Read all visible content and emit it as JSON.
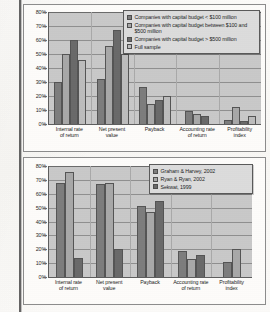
{
  "page": {
    "gutter_present": true
  },
  "charts": [
    {
      "id": "capital-budget-size-chart",
      "legend": [
        {
          "label": "Companies with capital budget < $100 million",
          "color": "#7d7d7d"
        },
        {
          "label": "Companies with capital budget between $100 and $500 million",
          "color": "#a8a8a8"
        },
        {
          "label": "Companies with capital budget > $500 million",
          "color": "#6a6a6a"
        },
        {
          "label": "Full sample",
          "color": "#bdbdbd"
        }
      ],
      "yticks": [
        "0%",
        "10%",
        "20%",
        "30%",
        "40%",
        "50%",
        "60%",
        "70%",
        "80%"
      ],
      "categories": [
        "Internal rate of return",
        "Net present value",
        "Payback",
        "Accounting rate of return",
        "Profitability index"
      ]
    },
    {
      "id": "studies-comparison-chart",
      "legend": [
        {
          "label": "Graham & Harvey, 2002",
          "color": "#7d7d7d"
        },
        {
          "label": "Ryan & Ryan, 2002",
          "color": "#a8a8a8"
        },
        {
          "label": "Sekwat, 1999",
          "color": "#6a6a6a"
        }
      ],
      "yticks": [
        "0%",
        "10%",
        "20%",
        "30%",
        "40%",
        "50%",
        "60%",
        "70%",
        "80%"
      ],
      "categories": [
        "Internal rate of return",
        "Net present value",
        "Payback",
        "Accounting rate of return",
        "Profitability index"
      ]
    }
  ],
  "chart_data": [
    {
      "type": "bar",
      "title": "",
      "xlabel": "",
      "ylabel": "",
      "ylim": [
        0,
        80
      ],
      "yunit": "%",
      "grid": true,
      "legend_position": "upper-right",
      "categories": [
        "Internal rate of return",
        "Net present value",
        "Payback",
        "Accounting rate of return",
        "Profitability index"
      ],
      "series": [
        {
          "name": "Companies with capital budget < $100 million",
          "values": [
            30,
            32.5,
            26.5,
            9.5,
            3
          ]
        },
        {
          "name": "Companies with capital budget between $100 and $500 million",
          "values": [
            50,
            56,
            14.5,
            7,
            12
          ]
        },
        {
          "name": "Companies with capital budget > $500 million",
          "values": [
            60,
            67,
            17,
            5.5,
            2.5
          ]
        },
        {
          "name": "Full sample",
          "values": [
            45.5,
            50,
            20,
            null,
            6
          ]
        }
      ]
    },
    {
      "type": "bar",
      "title": "",
      "xlabel": "",
      "ylabel": "",
      "ylim": [
        0,
        80
      ],
      "yunit": "%",
      "grid": true,
      "legend_position": "upper-right",
      "categories": [
        "Internal rate of return",
        "Net present value",
        "Payback",
        "Accounting rate of return",
        "Profitability index"
      ],
      "series": [
        {
          "name": "Graham & Harvey, 2002",
          "values": [
            68,
            67,
            51,
            18.5,
            11
          ]
        },
        {
          "name": "Ryan & Ryan, 2002",
          "values": [
            75.5,
            68,
            47,
            13,
            20.5
          ]
        },
        {
          "name": "Sekwat, 1999",
          "values": [
            14,
            20.5,
            55,
            16,
            null
          ]
        }
      ]
    }
  ]
}
